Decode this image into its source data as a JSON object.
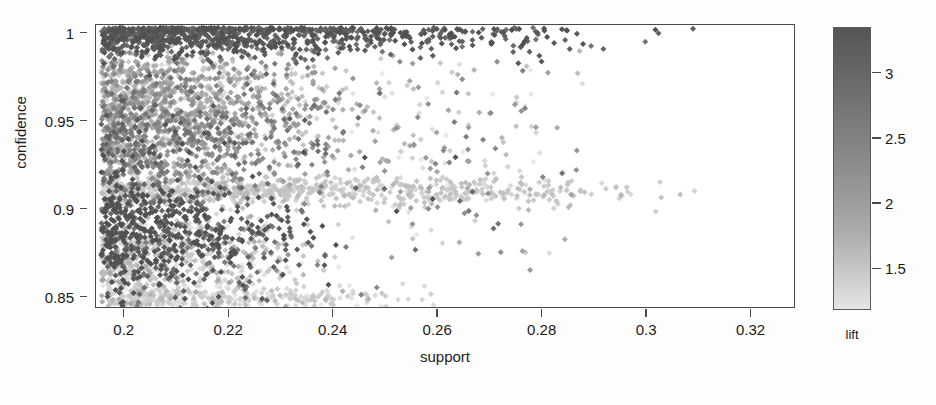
{
  "chart_data": {
    "type": "scatter",
    "title": "",
    "xlabel": "support",
    "ylabel": "confidence",
    "xlim": [
      0.1945,
      0.3285
    ],
    "ylim": [
      0.8435,
      1.005
    ],
    "grid": false,
    "xticks": [
      0.2,
      0.22,
      0.24,
      0.26,
      0.28,
      0.3,
      0.32
    ],
    "xtick_labels": [
      "0.2",
      "0.22",
      "0.24",
      "0.26",
      "0.28",
      "0.3",
      "0.32"
    ],
    "yticks": [
      0.85,
      0.9,
      0.95,
      1
    ],
    "ytick_labels": [
      "0.85",
      "0.9",
      "0.95",
      "1"
    ],
    "colorbar": {
      "label": "lift",
      "ticks": [
        1.5,
        2,
        2.5,
        3
      ],
      "tick_labels": [
        "1.5",
        "2",
        "2.5",
        "3"
      ],
      "vmin": 1.18,
      "vmax": 3.35,
      "orientation": "vertical",
      "position": "right",
      "low_color": "#e6e6e6",
      "high_color": "#555555"
    },
    "point_color_dark": "#5a5a5a",
    "point_color_mid": "#999999",
    "point_color_light": "#b8b8b8",
    "marker": "diamond",
    "marker_size": 3,
    "n_points_approx": 4800,
    "clusters": [
      {
        "name": "top-confidence-band",
        "y_center": 0.999,
        "y_spread": 0.006,
        "x_min": 0.1955,
        "x_max": 0.316,
        "lift_center": 3.15,
        "lift_spread": 0.18,
        "n": 900,
        "density_decay": 3.2
      },
      {
        "name": "upper-mid-cloud",
        "y_center": 0.965,
        "y_spread": 0.016,
        "x_min": 0.1955,
        "x_max": 0.252,
        "lift_center": 2.0,
        "lift_spread": 0.45,
        "n": 900,
        "density_decay": 2.6
      },
      {
        "name": "mid-cloud",
        "y_center": 0.938,
        "y_spread": 0.016,
        "x_min": 0.1955,
        "x_max": 0.252,
        "lift_center": 2.35,
        "lift_spread": 0.45,
        "n": 800,
        "density_decay": 2.4
      },
      {
        "name": "band-0.91",
        "y_center": 0.9105,
        "y_spread": 0.004,
        "x_min": 0.1955,
        "x_max": 0.3135,
        "lift_center": 1.6,
        "lift_spread": 0.12,
        "n": 700,
        "density_decay": 2.0
      },
      {
        "name": "lower-dark-streaks",
        "y_center": 0.888,
        "y_spread": 0.018,
        "x_min": 0.1955,
        "x_max": 0.248,
        "lift_center": 3.0,
        "lift_spread": 0.3,
        "n": 650,
        "density_decay": 2.8
      },
      {
        "name": "lower-light-cloud",
        "y_center": 0.872,
        "y_spread": 0.014,
        "x_min": 0.1955,
        "x_max": 0.245,
        "lift_center": 1.55,
        "lift_spread": 0.3,
        "n": 550,
        "density_decay": 2.6
      },
      {
        "name": "bottom-edge-row",
        "y_center": 0.8505,
        "y_spread": 0.003,
        "x_min": 0.1965,
        "x_max": 0.268,
        "lift_center": 1.45,
        "lift_spread": 0.2,
        "n": 300,
        "density_decay": 2.6
      },
      {
        "name": "sparse-right-scatter",
        "y_center": 0.93,
        "y_spread": 0.035,
        "x_min": 0.248,
        "x_max": 0.288,
        "lift_center": 1.9,
        "lift_spread": 0.55,
        "n": 180,
        "density_decay": 1.4
      }
    ]
  },
  "axes": {
    "x_label": "support",
    "y_label": "confidence"
  },
  "legend": {
    "title": "lift"
  }
}
